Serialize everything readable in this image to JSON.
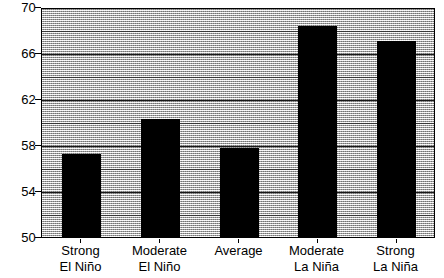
{
  "chart_data": {
    "type": "bar",
    "title": "",
    "subtitle": "",
    "xlabel": "",
    "ylabel": "",
    "categories": [
      "Strong El Niño",
      "Moderate El Niño",
      "Average",
      "Moderate La Niña",
      "Strong La Niña"
    ],
    "category_lines": [
      [
        "Strong",
        "El Niño"
      ],
      [
        "Moderate",
        "El Niño"
      ],
      [
        "Average",
        ""
      ],
      [
        "Moderate",
        "La Niña"
      ],
      [
        "Strong",
        "La Niña"
      ]
    ],
    "values": [
      57.4,
      60.4,
      57.9,
      68.5,
      67.2
    ],
    "ylim": [
      50,
      70
    ],
    "yticks": [
      50,
      54,
      58,
      62,
      66,
      70
    ],
    "ytick_labels": [
      "50",
      "54",
      "58",
      "62",
      "66",
      "70"
    ],
    "yminor_ticks": [
      52,
      56,
      60,
      64,
      68
    ],
    "grid": true,
    "legend": "none",
    "bar_color": "#000000",
    "plot_background": "#d6d6d6",
    "axis_color": "#000000"
  }
}
